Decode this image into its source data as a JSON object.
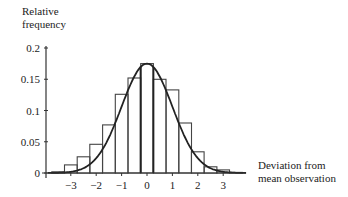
{
  "chart_data": {
    "type": "bar",
    "title": "",
    "ylabel": "Relative frequency",
    "xlabel": "Deviation from mean observation",
    "ylabel_lines": [
      "Relative",
      "frequency"
    ],
    "xlabel_lines": [
      "Deviation from",
      "mean observation"
    ],
    "xlim": [
      -4,
      4
    ],
    "ylim": [
      0,
      0.2
    ],
    "x_ticks": [
      -3,
      -2,
      -1,
      0,
      1,
      2,
      3
    ],
    "x_tick_labels": [
      "−3",
      "−2",
      "−1",
      "0",
      "1",
      "2",
      "3"
    ],
    "y_ticks": [
      0,
      0.05,
      0.1,
      0.15,
      0.2
    ],
    "y_tick_labels": [
      "0",
      "0.05",
      "0.1",
      "0.15",
      "0.2"
    ],
    "bin_width": 0.5,
    "bin_centers": [
      -3.5,
      -3.0,
      -2.5,
      -2.0,
      -1.5,
      -1.0,
      -0.5,
      0.0,
      0.5,
      1.0,
      1.5,
      2.0,
      2.5,
      3.0,
      3.5
    ],
    "values": [
      0.002,
      0.013,
      0.026,
      0.046,
      0.077,
      0.126,
      0.152,
      0.175,
      0.15,
      0.133,
      0.08,
      0.034,
      0.01,
      0.005,
      0.001
    ],
    "curve": {
      "name": "Normal density curve",
      "mean": 0,
      "sd": 1,
      "peak": 0.175
    },
    "grid": false,
    "legend": "none"
  }
}
